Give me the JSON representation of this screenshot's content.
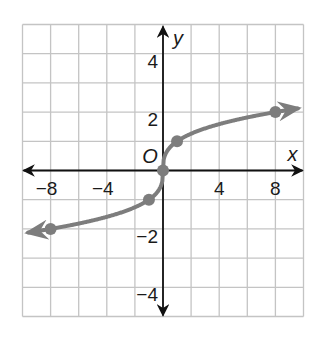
{
  "chart_data": {
    "type": "line",
    "title": "",
    "xlabel": "x",
    "ylabel": "y",
    "origin_label": "O",
    "xlim": [
      -10,
      10
    ],
    "ylim": [
      -5,
      5
    ],
    "grid": true,
    "x_grid_step": 2,
    "y_grid_step": 1,
    "x_ticks": [
      {
        "value": -8,
        "label": "−8"
      },
      {
        "value": -4,
        "label": "−4"
      },
      {
        "value": 4,
        "label": "4"
      },
      {
        "value": 8,
        "label": "8"
      }
    ],
    "y_ticks": [
      {
        "value": 4,
        "label": "4"
      },
      {
        "value": 2,
        "label": "2"
      },
      {
        "value": -2,
        "label": "−2"
      },
      {
        "value": -4,
        "label": "−4"
      }
    ],
    "series": [
      {
        "name": "cube root curve",
        "function": "y = cbrt(x)",
        "arrows_both_ends": true,
        "points": [
          {
            "x": -8,
            "y": -2
          },
          {
            "x": -1,
            "y": -1
          },
          {
            "x": 0,
            "y": 0
          },
          {
            "x": 1,
            "y": 1
          },
          {
            "x": 8,
            "y": 2
          }
        ]
      }
    ]
  },
  "colors": {
    "curve": "#7d7d7d",
    "grid": "#c4c4c4",
    "axes": "#111111",
    "background": "#ffffff"
  }
}
